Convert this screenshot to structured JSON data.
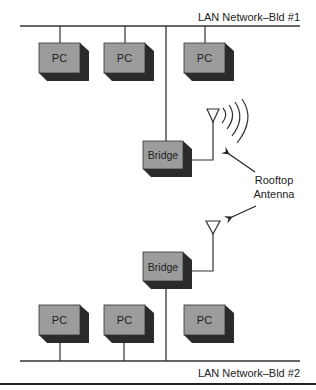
{
  "diagram": {
    "networks": {
      "top": {
        "label": "LAN Network–Bld #1"
      },
      "bottom": {
        "label": "LAN Network–Bld #2"
      }
    },
    "nodes": {
      "pc1": {
        "label": "PC"
      },
      "pc2": {
        "label": "PC"
      },
      "pc3": {
        "label": "PC"
      },
      "pc4": {
        "label": "PC"
      },
      "pc5": {
        "label": "PC"
      },
      "pc6": {
        "label": "PC"
      },
      "bridge1": {
        "label": "Bridge"
      },
      "bridge2": {
        "label": "Bridge"
      }
    },
    "annotation": {
      "line1": "Rooftop",
      "line2": "Antenna"
    },
    "colors": {
      "box_front": "#9c9c9c",
      "box_shadow": "#2b2b2b",
      "line": "#333333"
    }
  }
}
